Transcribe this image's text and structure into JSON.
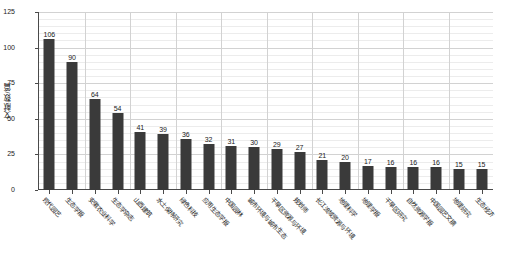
{
  "chart_data": {
    "type": "bar",
    "title": "",
    "xlabel": "",
    "ylabel": "文献数/篇",
    "ylim": [
      0,
      125
    ],
    "yticks": [
      0,
      25,
      50,
      75,
      100,
      125
    ],
    "grid": true,
    "legend": "none",
    "bar_color": "#3a3a3a",
    "categories": [
      "现代园艺",
      "生态学报",
      "安徽农业科学",
      "生态学杂志",
      "山西建筑",
      "水土保持研究",
      "绿色科技",
      "应用生态学报",
      "中国园林",
      "城市环境与城市生态",
      "干旱区资源与环境",
      "规划师",
      "长江流域资源与环境",
      "地理科学",
      "地理学报",
      "干旱区研究",
      "自然资源学报",
      "中国园艺文摘",
      "地理研究",
      "生态经济"
    ],
    "values": [
      106,
      90,
      64,
      54,
      41,
      39,
      36,
      32,
      31,
      30,
      29,
      27,
      21,
      20,
      17,
      16,
      16,
      16,
      15,
      15
    ]
  }
}
